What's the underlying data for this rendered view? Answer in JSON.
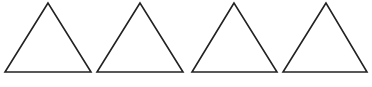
{
  "diagram": {
    "type": "shapes",
    "stroke_color": "#222222",
    "fill_color": "#ffffff",
    "stroke_width": 1.6,
    "shapes": [
      {
        "name": "triangle-1",
        "shape": "triangle",
        "points": [
          [
            48,
            3
          ],
          [
            5,
            72
          ],
          [
            91,
            72
          ]
        ]
      },
      {
        "name": "triangle-2",
        "shape": "triangle",
        "points": [
          [
            140,
            3
          ],
          [
            97,
            72
          ],
          [
            183,
            72
          ]
        ]
      },
      {
        "name": "triangle-3",
        "shape": "triangle",
        "points": [
          [
            234,
            3
          ],
          [
            192,
            72
          ],
          [
            277,
            72
          ]
        ]
      },
      {
        "name": "triangle-4",
        "shape": "triangle",
        "points": [
          [
            326,
            3
          ],
          [
            283,
            72
          ],
          [
            367,
            72
          ]
        ]
      }
    ]
  }
}
